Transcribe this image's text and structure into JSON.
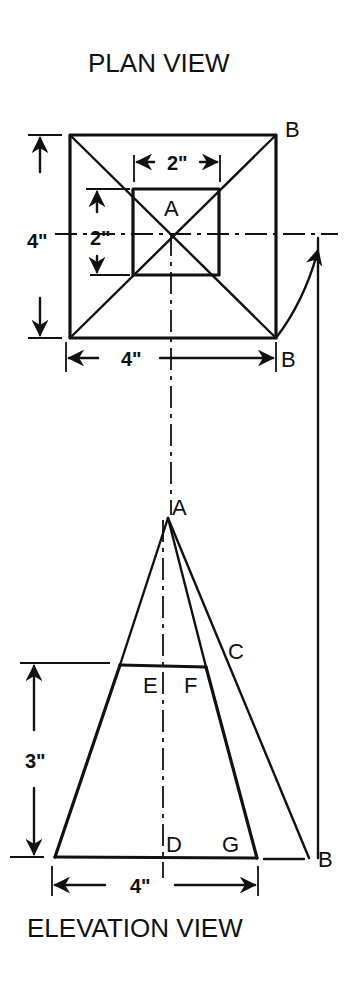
{
  "titles": {
    "plan": "PLAN VIEW",
    "elevation": "ELEVATION VIEW"
  },
  "plan_view": {
    "labels": {
      "apex": "A",
      "corner_top_right": "B",
      "corner_bottom_right": "B"
    },
    "dimensions": {
      "outer_height": "4\"",
      "outer_width": "4\"",
      "inner_width": "2\"",
      "inner_height": "2\""
    }
  },
  "elevation_view": {
    "labels": {
      "apex": "A",
      "point_c": "C",
      "point_e": "E",
      "point_f": "F",
      "point_d": "D",
      "point_g": "G",
      "point_b": "B"
    },
    "dimensions": {
      "height": "3\"",
      "base_width": "4\""
    }
  }
}
